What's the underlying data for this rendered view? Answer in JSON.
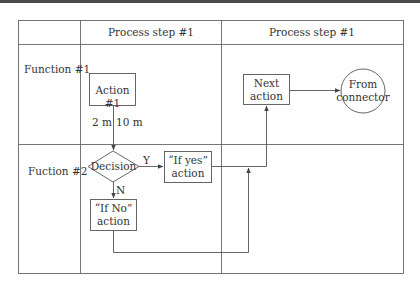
{
  "header": {
    "columns": [
      "",
      "Process step #1",
      "Process step #1"
    ]
  },
  "rows": [
    {
      "label": "Function #1"
    },
    {
      "label": "Fuction #2"
    }
  ],
  "nodes": {
    "action1": {
      "label": "Action #1"
    },
    "next_action": {
      "line1": "Next",
      "line2": "action"
    },
    "connector": {
      "line1": "From",
      "line2": "connector"
    },
    "decision": {
      "label": "Decision"
    },
    "if_yes": {
      "line1": "“If yes”",
      "line2": "action"
    },
    "if_no": {
      "line1": "“If No”",
      "line2": "action"
    }
  },
  "annotations": {
    "time_left": "2 m",
    "time_right": "10 m",
    "yes_label": "Y",
    "no_label": "N"
  },
  "colors": {
    "line": "#555555",
    "text": "#333333",
    "topbar": "#4a4a4a"
  }
}
